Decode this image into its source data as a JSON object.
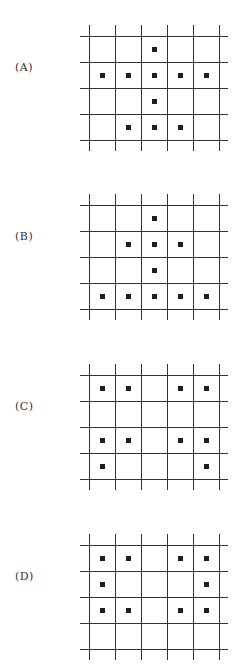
{
  "figure": {
    "grid": {
      "columns": 5,
      "rows": 4
    },
    "options": [
      {
        "label": "(A)",
        "top": 25,
        "label_y": 61,
        "dots": [
          [
            0,
            2
          ],
          [
            1,
            0
          ],
          [
            1,
            1
          ],
          [
            1,
            2
          ],
          [
            1,
            3
          ],
          [
            1,
            4
          ],
          [
            2,
            2
          ],
          [
            3,
            1
          ],
          [
            3,
            2
          ],
          [
            3,
            3
          ]
        ]
      },
      {
        "label": "(B)",
        "top": 194,
        "label_y": 230,
        "dots": [
          [
            0,
            2
          ],
          [
            1,
            1
          ],
          [
            1,
            2
          ],
          [
            1,
            3
          ],
          [
            2,
            2
          ],
          [
            3,
            0
          ],
          [
            3,
            1
          ],
          [
            3,
            2
          ],
          [
            3,
            3
          ],
          [
            3,
            4
          ]
        ]
      },
      {
        "label": "(C)",
        "top": 364,
        "label_y": 400,
        "dots": [
          [
            0,
            0
          ],
          [
            0,
            1
          ],
          [
            0,
            3
          ],
          [
            0,
            4
          ],
          [
            2,
            0
          ],
          [
            2,
            1
          ],
          [
            2,
            3
          ],
          [
            2,
            4
          ],
          [
            3,
            0
          ],
          [
            3,
            4
          ]
        ]
      },
      {
        "label": "(D)",
        "top": 534,
        "label_y": 570,
        "dots": [
          [
            0,
            0
          ],
          [
            0,
            1
          ],
          [
            0,
            3
          ],
          [
            0,
            4
          ],
          [
            1,
            0
          ],
          [
            1,
            4
          ],
          [
            2,
            0
          ],
          [
            2,
            1
          ],
          [
            2,
            3
          ],
          [
            2,
            4
          ]
        ]
      }
    ]
  }
}
